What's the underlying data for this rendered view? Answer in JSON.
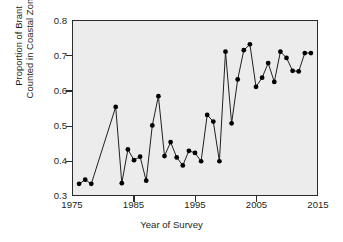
{
  "chart_data": {
    "type": "line",
    "title": "",
    "xlabel": "Year of Survey",
    "ylabel": "Proportion of Brant\nCounted in Coastal Zone",
    "xlim": [
      1975,
      2015
    ],
    "ylim": [
      0.3,
      0.8
    ],
    "xticks": [
      1975,
      1985,
      1995,
      2005,
      2015
    ],
    "yticks": [
      0.3,
      0.4,
      0.5,
      0.6,
      0.7,
      0.8
    ],
    "grid": false,
    "legend": null,
    "marker": "filled-circle",
    "line_color": "#231f20",
    "marker_color": "#000000",
    "plot_background": "#ececec",
    "x": [
      1976,
      1977,
      1978,
      1982,
      1983,
      1984,
      1985,
      1986,
      1987,
      1988,
      1989,
      1990,
      1991,
      1992,
      1993,
      1994,
      1995,
      1996,
      1997,
      1998,
      1999,
      2000,
      2001,
      2002,
      2003,
      2004,
      2005,
      2006,
      2007,
      2008,
      2009,
      2010,
      2011,
      2012,
      2013,
      2014
    ],
    "values": [
      0.332,
      0.344,
      0.332,
      0.553,
      0.334,
      0.431,
      0.4,
      0.41,
      0.341,
      0.5,
      0.584,
      0.412,
      0.452,
      0.408,
      0.385,
      0.427,
      0.421,
      0.397,
      0.53,
      0.511,
      0.397,
      0.712,
      0.506,
      0.632,
      0.716,
      0.733,
      0.611,
      0.637,
      0.679,
      0.625,
      0.712,
      0.694,
      0.657,
      0.655,
      0.708,
      0.708
    ]
  },
  "axes": {
    "y_tick_labels": [
      "0.8",
      "0.7",
      "0.6",
      "0.5",
      "0.4",
      "0.3"
    ],
    "x_tick_labels": [
      "1975",
      "1985",
      "1995",
      "2005",
      "2015"
    ],
    "x_title": "Year of Survey",
    "y_title": "Proportion of Brant\nCounted in Coastal Zone"
  }
}
